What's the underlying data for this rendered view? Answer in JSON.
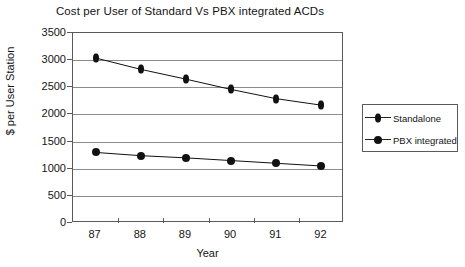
{
  "chart_data": {
    "type": "line",
    "title": "Cost per User of Standard Vs PBX integrated ACDs",
    "xlabel": "Year",
    "ylabel": "$ per User Station",
    "categories": [
      "87",
      "88",
      "89",
      "90",
      "91",
      "92"
    ],
    "ylim": [
      0,
      3500
    ],
    "yticks": [
      0,
      500,
      1000,
      1500,
      2000,
      2500,
      3000,
      3500
    ],
    "ytick_labels": [
      "0",
      "500",
      "1000",
      "1500",
      "2000",
      "2500",
      "3000",
      "3500"
    ],
    "grid": true,
    "legend_position": "right",
    "series": [
      {
        "name": "Standalone",
        "marker": "diamond",
        "color": "#111111",
        "values": [
          3040,
          2830,
          2650,
          2460,
          2290,
          2170
        ]
      },
      {
        "name": "PBX integrated",
        "marker": "circle",
        "color": "#111111",
        "values": [
          1300,
          1240,
          1200,
          1150,
          1100,
          1050
        ]
      }
    ]
  },
  "legend": {
    "items": [
      {
        "label": "Standalone",
        "marker": "diamond-icon"
      },
      {
        "label": "PBX integrated",
        "marker": "circle-icon"
      }
    ]
  }
}
